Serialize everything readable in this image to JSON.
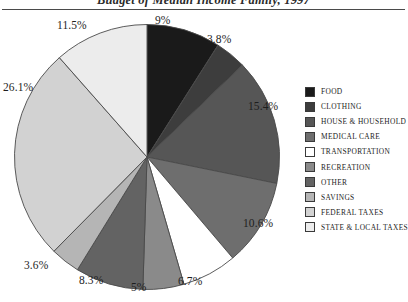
{
  "chart_data": {
    "type": "pie",
    "title": "Budget of Median Income Family, 1997",
    "xlabel": "",
    "ylabel": "",
    "legend_position": "right",
    "grid": false,
    "start_angle_deg": 0,
    "direction": "clockwise",
    "categories": [
      "FOOD",
      "CLOTHING",
      "HOUSE & HOUSEHOLD",
      "MEDICAL CARE",
      "TRANSPORTATION",
      "RECREATION",
      "OTHER",
      "SAVINGS",
      "FEDERAL TAXES",
      "STATE & LOCAL TAXES"
    ],
    "values": [
      9,
      3.8,
      15.4,
      10.6,
      6.7,
      5,
      8.3,
      3.6,
      26.1,
      11.5
    ],
    "value_labels": [
      "9%",
      "3.8%",
      "15.4%",
      "10.6%",
      "6.7%",
      "5%",
      "8.3%",
      "3.6%",
      "26.1%",
      "11.5%"
    ],
    "colors": [
      "#1a1a1a",
      "#3d3d3d",
      "#565656",
      "#6e6e6e",
      "#ffffff",
      "#8a8a8a",
      "#636363",
      "#b5b5b5",
      "#d2d2d2",
      "#ececec"
    ],
    "slice_border_color": "#4a4a4a",
    "label_color": "#1e1e1e"
  },
  "legend": {
    "items": [
      {
        "label": "FOOD",
        "color": "#1a1a1a"
      },
      {
        "label": "CLOTHING",
        "color": "#3d3d3d"
      },
      {
        "label": "HOUSE & HOUSEHOLD",
        "color": "#565656"
      },
      {
        "label": "MEDICAL CARE",
        "color": "#6e6e6e"
      },
      {
        "label": "TRANSPORTATION",
        "color": "#ffffff"
      },
      {
        "label": "RECREATION",
        "color": "#8a8a8a"
      },
      {
        "label": "OTHER",
        "color": "#636363"
      },
      {
        "label": "SAVINGS",
        "color": "#b5b5b5"
      },
      {
        "label": "FEDERAL TAXES",
        "color": "#d2d2d2"
      },
      {
        "label": "STATE & LOCAL TAXES",
        "color": "#ececec"
      }
    ]
  },
  "labels": {
    "positions": [
      {
        "text": "9%",
        "left": 155,
        "top": 14,
        "align": "left"
      },
      {
        "text": "3.8%",
        "left": 207,
        "top": 33,
        "align": "left"
      },
      {
        "text": "15.4%",
        "left": 248,
        "top": 100,
        "align": "left"
      },
      {
        "text": "10.6%",
        "left": 243,
        "top": 217,
        "align": "left"
      },
      {
        "text": "6.7%",
        "left": 178,
        "top": 275,
        "align": "left"
      },
      {
        "text": "5%",
        "left": 131,
        "top": 281,
        "align": "left"
      },
      {
        "text": "8.3%",
        "left": 79,
        "top": 274,
        "align": "left"
      },
      {
        "text": "3.6%",
        "left": 24,
        "top": 259,
        "align": "left"
      },
      {
        "text": "26.1%",
        "left": 3,
        "top": 81,
        "align": "left"
      },
      {
        "text": "11.5%",
        "left": 57,
        "top": 19,
        "align": "left"
      }
    ]
  }
}
